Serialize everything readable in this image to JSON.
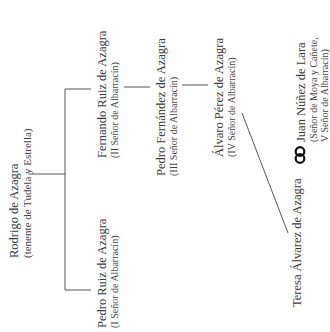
{
  "diagram": {
    "type": "family-tree",
    "orientation": "rotated-90-ccw",
    "line_color": "#555555",
    "nodes": [
      {
        "id": "rodrigo",
        "name": "Rodrigo de Azagra",
        "title": "(tenente de Tudela y Estrella)"
      },
      {
        "id": "fernando",
        "name": "Fernando Ruiz de Azagra",
        "title": "(II Señor de Albarracín)"
      },
      {
        "id": "pedro_ruiz",
        "name": "Pedro Ruiz de Azagra",
        "title": "(I Señor de Albarracín)"
      },
      {
        "id": "pedro_fernandez",
        "name": "Pedro Fernández de Azagra",
        "title": "(III Señor de Albarracín)"
      },
      {
        "id": "alvaro",
        "name": "Álvaro Pérez de Azagra",
        "title": "(IV Señor de Albarracín)"
      },
      {
        "id": "teresa",
        "name": "Teresa Álvarez de Azagra",
        "title": ""
      },
      {
        "id": "juan",
        "name": "Juan Núñez de Lara",
        "title_line1": "(Señor de Moya y Cañete,",
        "title_line2": "V Señor de Albarracín)"
      }
    ],
    "edges": [
      {
        "from": "rodrigo",
        "to": "fernando",
        "kind": "child"
      },
      {
        "from": "rodrigo",
        "to": "pedro_ruiz",
        "kind": "child"
      },
      {
        "from": "fernando",
        "to": "pedro_fernandez",
        "kind": "child"
      },
      {
        "from": "pedro_fernandez",
        "to": "alvaro",
        "kind": "child"
      },
      {
        "from": "alvaro",
        "to": "teresa",
        "kind": "child"
      },
      {
        "from": "teresa",
        "to": "juan",
        "kind": "marriage"
      }
    ],
    "marriage_symbol": "interlocked-rings"
  }
}
